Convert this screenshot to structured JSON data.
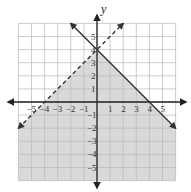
{
  "chart_data": {
    "type": "line",
    "title": "",
    "xlabel": "",
    "ylabel": "y",
    "xlim": [
      -6,
      6
    ],
    "ylim": [
      -6,
      6
    ],
    "grid": true,
    "x_ticks": [
      -5,
      -4,
      -3,
      -2,
      -1,
      1,
      2,
      3,
      4,
      5
    ],
    "y_ticks": [
      -5,
      -4,
      -3,
      -2,
      -1,
      1,
      2,
      3,
      4,
      5
    ],
    "x_tick_labels": [
      "−5",
      "−4",
      "−3",
      "−2",
      "−1",
      "1",
      "2",
      "3",
      "4",
      "5"
    ],
    "y_tick_labels": [
      "−5",
      "−4",
      "−3",
      "−2",
      "−1",
      "1",
      "2",
      "3",
      "4",
      "5"
    ],
    "series": [
      {
        "name": "y = -x + 4",
        "style": "solid",
        "slope": -1,
        "intercept": 4,
        "points": [
          [
            -2,
            6
          ],
          [
            6,
            -2
          ]
        ]
      },
      {
        "name": "y = x + 4",
        "style": "dashed",
        "slope": 1,
        "intercept": 4,
        "points": [
          [
            -6,
            -2
          ],
          [
            2,
            6
          ]
        ]
      }
    ],
    "shaded_region": "y <= -x + 4 and y < x + 4",
    "colors": {
      "shade": "#d9d9d9",
      "grid": "#b8b8b8",
      "line": "#333333",
      "axis": "#222222"
    }
  }
}
